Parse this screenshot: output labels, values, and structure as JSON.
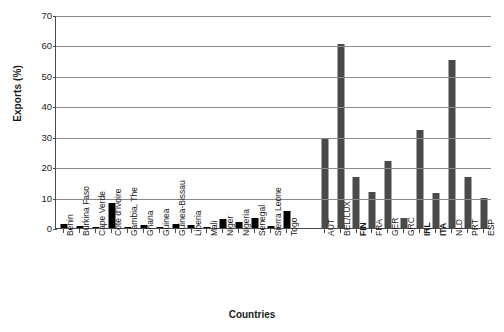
{
  "chart_data": {
    "type": "bar",
    "title": "",
    "xlabel": "Countries",
    "ylabel": "Exports (%)",
    "ylim": [
      0,
      70
    ],
    "yticks": [
      0,
      10,
      20,
      30,
      40,
      50,
      60,
      70
    ],
    "grid": true,
    "legend": "none",
    "group_gap_after_index": 14,
    "colors": {
      "africa_bar": "#000000",
      "europe_bar": "#4a4a4a",
      "gridline": "#8a8a8a",
      "axis": "#4a4a4a",
      "text": "#1a1a1a",
      "background": "#ffffff"
    },
    "categories": [
      "Benin",
      "Burkina Faso",
      "Cape Verde",
      "Côte d'Ivoire",
      "Gambia, The",
      "Ghana",
      "Guinea",
      "Guinea-Bissau",
      "Liberia",
      "Mali",
      "Niger",
      "Nigeria",
      "Senegal",
      "Sierra Leone",
      "Togo",
      "AUT",
      "BEL/LUX",
      "FIN",
      "FRA",
      "GER",
      "GRC",
      "IRL",
      "ITA",
      "NLD",
      "PRT",
      "ESP"
    ],
    "values": [
      1.2,
      0.7,
      0.3,
      8.2,
      0.3,
      1.0,
      0.3,
      1.2,
      0.9,
      0.2,
      3.1,
      1.9,
      3.4,
      0.5,
      5.6,
      29.2,
      60.5,
      16.8,
      11.8,
      22.1,
      3.4,
      32.1,
      11.4,
      55.2,
      16.8,
      10.0
    ],
    "groups": [
      "africa",
      "africa",
      "africa",
      "africa",
      "africa",
      "africa",
      "africa",
      "africa",
      "africa",
      "africa",
      "africa",
      "africa",
      "africa",
      "africa",
      "africa",
      "europe",
      "europe",
      "europe",
      "europe",
      "europe",
      "europe",
      "europe",
      "europe",
      "europe",
      "europe",
      "europe"
    ],
    "bold_labels": [
      "FIN",
      "IRL",
      "ITA"
    ]
  }
}
